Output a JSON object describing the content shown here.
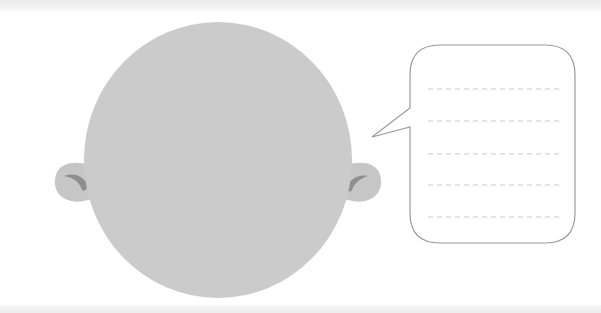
{
  "illustration": {
    "description": "Bald head silhouette with two ears and an empty speech bubble with dashed writing lines",
    "colors": {
      "head_fill": "#cbcbcb",
      "ear_fill": "#c6c6c6",
      "ear_detail": "#8e8e8e",
      "bubble_stroke": "#9a9a9a",
      "bubble_fill": "#ffffff",
      "dashed_line": "#c8c8c8",
      "background": "#ffffff"
    },
    "speech_bubble": {
      "line_count": 5,
      "lines": [
        "",
        "",
        "",
        "",
        ""
      ]
    }
  }
}
